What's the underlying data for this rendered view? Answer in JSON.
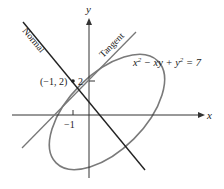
{
  "diagram": {
    "axes": {
      "x_label": "x",
      "y_label": "y",
      "tick_x": "−1",
      "tick_y": "2"
    },
    "point_label": "(−1, 2)",
    "lines": {
      "normal_label": "Normal",
      "tangent_label": "Tangent"
    },
    "curve": {
      "equation_prefix": "x",
      "equation_sup1": "2",
      "equation_mid": " − xy + y",
      "equation_sup2": "2",
      "equation_suffix": " = 7"
    },
    "colors": {
      "axes": "#333333",
      "normal": "#222222",
      "tangent": "#777777",
      "ellipse": "#777777"
    }
  }
}
